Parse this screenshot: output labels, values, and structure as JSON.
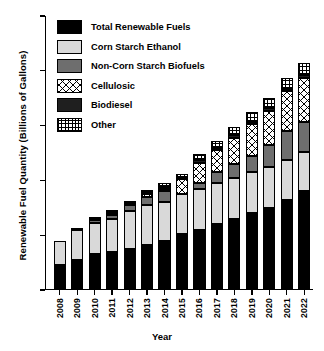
{
  "chart_data": {
    "type": "bar",
    "stacked": true,
    "title": "",
    "xlabel": "Year",
    "ylabel": "Renewable Fuel Quantity (Billions of Gallons)",
    "ylim": [
      0,
      100
    ],
    "yticks": [
      0,
      20,
      40,
      60,
      80,
      100
    ],
    "grid": false,
    "legend_position": "upper-left-inside",
    "categories": [
      "2008",
      "2009",
      "2010",
      "2011",
      "2012",
      "2013",
      "2014",
      "2015",
      "2016",
      "2017",
      "2018",
      "2019",
      "2020",
      "2021",
      "2022"
    ],
    "series": [
      {
        "name": "Total Renewable Fuels",
        "color": "#000000",
        "pattern": "solid-black",
        "values": [
          9.0,
          11.0,
          13.0,
          14.0,
          15.0,
          16.5,
          18.0,
          20.5,
          22.0,
          24.0,
          26.0,
          28.0,
          30.0,
          33.0,
          36.0
        ]
      },
      {
        "name": "Corn Starch Ethanol",
        "color": "#d9d9d9",
        "pattern": "solid-light-gray",
        "values": [
          9.0,
          11.0,
          11.5,
          12.0,
          14.0,
          14.5,
          14.0,
          14.5,
          15.0,
          15.0,
          15.0,
          15.0,
          15.0,
          14.5,
          14.5
        ]
      },
      {
        "name": "Non-Corn Starch Biofuels",
        "color": "#6e6e6e",
        "pattern": "solid-dark-gray",
        "values": [
          0.0,
          0.0,
          1.0,
          1.5,
          2.0,
          3.0,
          4.0,
          0.0,
          2.0,
          4.0,
          5.0,
          6.0,
          8.0,
          10.5,
          11.0
        ]
      },
      {
        "name": "Cellulosic",
        "color": "#ffffff",
        "pattern": "cross-hatch-diagonal",
        "values": [
          0.0,
          0.0,
          0.0,
          0.5,
          0.0,
          1.0,
          1.0,
          5.5,
          7.5,
          8.0,
          9.5,
          11.5,
          12.5,
          14.5,
          16.0
        ]
      },
      {
        "name": "Biodiesel",
        "color": "#1f1f1f",
        "pattern": "solid-near-black",
        "values": [
          0.0,
          0.5,
          0.5,
          0.5,
          0.5,
          0.5,
          0.5,
          0.5,
          1.0,
          1.0,
          1.0,
          1.0,
          1.0,
          1.0,
          1.0
        ]
      },
      {
        "name": "Other",
        "color": "#ffffff",
        "pattern": "grid-hatch",
        "values": [
          0.0,
          0.0,
          0.5,
          0.5,
          1.0,
          1.0,
          1.5,
          1.5,
          2.0,
          2.5,
          3.0,
          3.5,
          3.5,
          4.0,
          4.5
        ]
      }
    ],
    "totals": [
      18.0,
      22.5,
      26.5,
      29.0,
      32.5,
      36.5,
      39.0,
      42.5,
      49.5,
      54.5,
      59.5,
      65.0,
      70.0,
      77.5,
      83.0
    ]
  },
  "legend": {
    "items": [
      {
        "label": "Total Renewable Fuels"
      },
      {
        "label": "Corn Starch Ethanol"
      },
      {
        "label": "Non-Corn Starch Biofuels"
      },
      {
        "label": "Cellulosic"
      },
      {
        "label": "Biodiesel"
      },
      {
        "label": "Other"
      }
    ]
  }
}
